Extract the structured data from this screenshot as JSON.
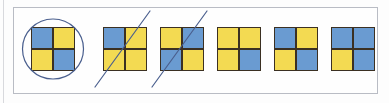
{
  "worksheet": {
    "title": "Two-by-two square colouring exercise",
    "panel_label": "answer-row-panel",
    "colors": {
      "blue": "#6a9bd1",
      "yellow": "#f3da52",
      "grid_line": "#3b3022",
      "ink": "#4a5f8e",
      "frame": "#b9bcc4",
      "background": "#fefefe"
    },
    "items": [
      {
        "index": 1,
        "name": "square-1",
        "cells": [
          "blue",
          "yellow",
          "yellow",
          "blue"
        ],
        "cell_labels": [
          "top-left",
          "top-right",
          "bottom-left",
          "bottom-right"
        ],
        "annotation": "circled",
        "annotation_name": "circle-mark",
        "left": 18
      },
      {
        "index": 2,
        "name": "square-2",
        "cells": [
          "blue",
          "yellow",
          "yellow",
          "yellow"
        ],
        "cell_labels": [
          "top-left",
          "top-right",
          "bottom-left",
          "bottom-right"
        ],
        "annotation": "crossed-out",
        "annotation_name": "strike-mark",
        "left": 90
      },
      {
        "index": 3,
        "name": "square-3",
        "cells": [
          "yellow",
          "blue",
          "blue",
          "yellow"
        ],
        "cell_labels": [
          "top-left",
          "top-right",
          "bottom-left",
          "bottom-right"
        ],
        "annotation": "crossed-out",
        "annotation_name": "strike-mark",
        "left": 147
      },
      {
        "index": 4,
        "name": "square-4",
        "cells": [
          "yellow",
          "yellow",
          "yellow",
          "blue"
        ],
        "cell_labels": [
          "top-left",
          "top-right",
          "bottom-left",
          "bottom-right"
        ],
        "annotation": "none",
        "annotation_name": "",
        "left": 204
      },
      {
        "index": 5,
        "name": "square-5",
        "cells": [
          "blue",
          "yellow",
          "yellow",
          "blue"
        ],
        "cell_labels": [
          "top-left",
          "top-right",
          "bottom-left",
          "bottom-right"
        ],
        "annotation": "none",
        "annotation_name": "",
        "left": 261
      },
      {
        "index": 6,
        "name": "square-6",
        "cells": [
          "blue",
          "blue",
          "yellow",
          "blue"
        ],
        "cell_labels": [
          "top-left",
          "top-right",
          "bottom-left",
          "bottom-right"
        ],
        "annotation": "none",
        "annotation_name": "",
        "left": 318
      }
    ]
  }
}
